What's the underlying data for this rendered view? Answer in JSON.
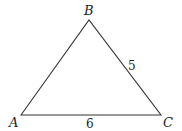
{
  "diagram": {
    "type": "triangle",
    "vertices": [
      {
        "id": "A",
        "label": "A",
        "x": 21,
        "y": 115
      },
      {
        "id": "B",
        "label": "B",
        "x": 89,
        "y": 20
      },
      {
        "id": "C",
        "label": "C",
        "x": 161,
        "y": 115
      }
    ],
    "sides": [
      {
        "from": "B",
        "to": "C",
        "label": "5"
      },
      {
        "from": "A",
        "to": "C",
        "label": "6"
      },
      {
        "from": "A",
        "to": "B",
        "label": ""
      }
    ],
    "stroke_color": "#333333"
  }
}
